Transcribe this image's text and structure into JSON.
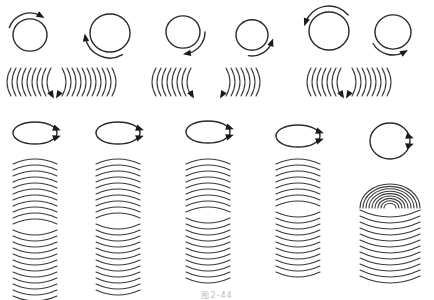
{
  "figure": {
    "caption": "图2-44",
    "colors": {
      "stroke": "#2a2a2a",
      "background": "#ffffff",
      "caption": "#bdbdbd"
    },
    "top_row": {
      "circles": [
        {
          "id": 1,
          "cx": 30,
          "cy": 35,
          "r": 17,
          "arrow": "clockwise-top"
        },
        {
          "id": 2,
          "cx": 110,
          "cy": 33,
          "r": 20,
          "arrow": "counterclockwise-bottom-left"
        },
        {
          "id": 3,
          "cx": 183,
          "cy": 32,
          "r": 17,
          "arrow": "clockwise-bottom-right"
        },
        {
          "id": 4,
          "cx": 252,
          "cy": 35,
          "r": 16,
          "arrow": "counterclockwise-bottom-right"
        },
        {
          "id": 5,
          "cx": 329,
          "cy": 31,
          "r": 20,
          "arrow": "counterclockwise-top-left"
        },
        {
          "id": 6,
          "cx": 393,
          "cy": 32,
          "r": 18,
          "arrow": "clockwise-bottom-left"
        }
      ],
      "arc_rows": [
        {
          "x": 5,
          "y": 68,
          "left_count": 9,
          "right_count": 11
        },
        {
          "x": 150,
          "y": 68,
          "left_count": 8,
          "right_count": 0
        },
        {
          "x": 222,
          "y": 68,
          "left_count": 0,
          "right_count": 7
        },
        {
          "x": 305,
          "y": 68,
          "left_count": 7,
          "right_count": 8
        }
      ]
    },
    "bottom_columns": [
      {
        "id": 1,
        "cx": 35,
        "ellipse_y": 133,
        "arrows": 2,
        "arcs_top": 11,
        "arcs_bottom": 12
      },
      {
        "id": 2,
        "cx": 118,
        "ellipse_y": 133,
        "arrows": 2,
        "arcs_top": 10,
        "arcs_bottom": 12
      },
      {
        "id": 3,
        "cx": 208,
        "ellipse_y": 132,
        "arrows": 2,
        "arcs_top": 9,
        "arcs_bottom": 11
      },
      {
        "id": 4,
        "cx": 298,
        "ellipse_y": 136,
        "arrows": 2,
        "arcs_top": 8,
        "arcs_bottom": 11
      },
      {
        "id": 5,
        "cx": 390,
        "ellipse_y": 141,
        "arrows": 2,
        "arcs_top": 0,
        "arcs_bottom": 12,
        "spiral": true
      }
    ]
  }
}
